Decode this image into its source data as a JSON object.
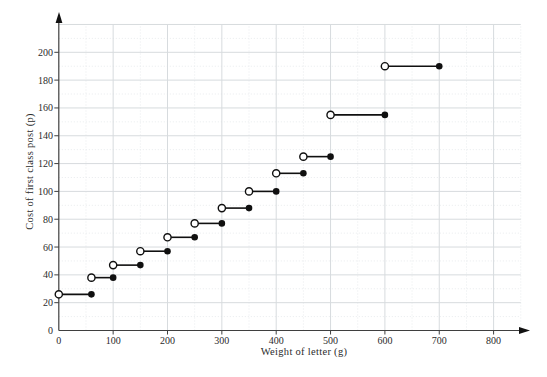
{
  "figure": {
    "background": "#ffffff",
    "text_color": "#2b2b2b",
    "axis_color": "#3f3f3f",
    "grid_major_color": "#d7dbde",
    "grid_minor_color": "#e8ebed",
    "data_color": "#101010"
  },
  "chart_data": {
    "type": "step",
    "title": "",
    "xlabel": "Weight of letter (g)",
    "ylabel": "Cost of first class post (p)",
    "x_ticks": [
      0,
      100,
      200,
      300,
      400,
      500,
      600,
      700,
      800
    ],
    "y_ticks": [
      0,
      20,
      40,
      60,
      80,
      100,
      120,
      140,
      160,
      180,
      200
    ],
    "xlim": [
      0,
      860
    ],
    "ylim": [
      0,
      224
    ],
    "grid": "major solid lines every 100 g / 20 p, faint dotted minor lines every 50 g / 10 p",
    "legend_position": "none",
    "endpoint_convention": "open circle at left end of each step (excluded), filled circle at right end (included)",
    "steps": [
      {
        "from_g": 0,
        "to_g": 60,
        "cost_p": 26
      },
      {
        "from_g": 60,
        "to_g": 100,
        "cost_p": 38
      },
      {
        "from_g": 100,
        "to_g": 150,
        "cost_p": 47
      },
      {
        "from_g": 150,
        "to_g": 200,
        "cost_p": 57
      },
      {
        "from_g": 200,
        "to_g": 250,
        "cost_p": 67
      },
      {
        "from_g": 250,
        "to_g": 300,
        "cost_p": 77
      },
      {
        "from_g": 300,
        "to_g": 350,
        "cost_p": 88
      },
      {
        "from_g": 350,
        "to_g": 400,
        "cost_p": 100
      },
      {
        "from_g": 400,
        "to_g": 450,
        "cost_p": 113
      },
      {
        "from_g": 450,
        "to_g": 500,
        "cost_p": 125
      },
      {
        "from_g": 500,
        "to_g": 600,
        "cost_p": 155
      },
      {
        "from_g": 600,
        "to_g": 700,
        "cost_p": 190
      }
    ]
  }
}
